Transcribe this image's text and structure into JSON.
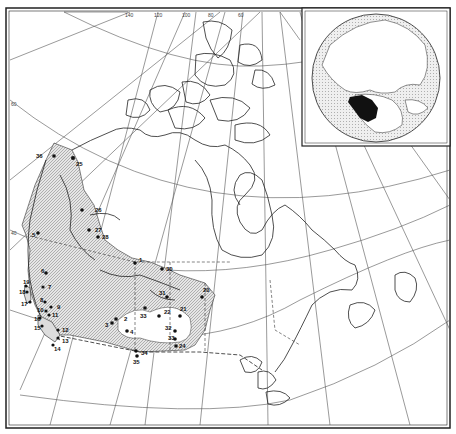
{
  "figure": {
    "type": "range map",
    "region": "Canada (western and central provinces and territories)",
    "inset": "Northern hemisphere globe with range highlighted in black"
  },
  "graticule": {
    "longitude_labels": [
      "140",
      "120",
      "100",
      "80",
      "60"
    ],
    "latitude_labels": [
      "60",
      "40"
    ]
  },
  "colors": {
    "ink": "#111111",
    "range_fill": "#cfcfcf",
    "ocean_inset": "#d8d8d8",
    "paper": "#ffffff"
  },
  "sites": [
    {
      "id": "1",
      "x": 135,
      "y": 263
    },
    {
      "id": "2",
      "x": 110,
      "y": 322
    },
    {
      "id": "3",
      "x": 118,
      "y": 327
    },
    {
      "id": "4",
      "x": 127,
      "y": 330
    },
    {
      "id": "5",
      "x": 38,
      "y": 233
    },
    {
      "id": "6",
      "x": 46,
      "y": 273
    },
    {
      "id": "7",
      "x": 43,
      "y": 287
    },
    {
      "id": "8",
      "x": 38,
      "y": 302
    },
    {
      "id": "9",
      "x": 51,
      "y": 307
    },
    {
      "id": "10",
      "x": 46,
      "y": 308
    },
    {
      "id": "11",
      "x": 49,
      "y": 315
    },
    {
      "id": "12",
      "x": 58,
      "y": 330
    },
    {
      "id": "13",
      "x": 58,
      "y": 338
    },
    {
      "id": "14",
      "x": 53,
      "y": 345
    },
    {
      "id": "15",
      "x": 40,
      "y": 326
    },
    {
      "id": "16",
      "x": 40,
      "y": 318
    },
    {
      "id": "17",
      "x": 30,
      "y": 302
    },
    {
      "id": "18",
      "x": 27,
      "y": 292
    },
    {
      "id": "19",
      "x": 26,
      "y": 286
    },
    {
      "id": "20",
      "x": 202,
      "y": 297
    },
    {
      "id": "22",
      "x": 159,
      "y": 316
    },
    {
      "id": "23",
      "x": 73,
      "y": 158
    },
    {
      "id": "24",
      "x": 175,
      "y": 345
    },
    {
      "id": "25",
      "x": 135,
      "y": 352
    },
    {
      "id": "26",
      "x": 82,
      "y": 210
    },
    {
      "id": "27",
      "x": 89,
      "y": 230
    },
    {
      "id": "28",
      "x": 98,
      "y": 237
    },
    {
      "id": "30",
      "x": 162,
      "y": 269
    },
    {
      "id": "31",
      "x": 167,
      "y": 300
    },
    {
      "id": "32",
      "x": 183,
      "y": 331
    },
    {
      "id": "33",
      "x": 145,
      "y": 308
    },
    {
      "id": "34",
      "x": 136,
      "y": 351
    },
    {
      "id": "36",
      "x": 54,
      "y": 156
    }
  ],
  "site_labels": [
    {
      "text": "36",
      "x": 36,
      "y": 156
    },
    {
      "text": "25",
      "x": 76,
      "y": 164
    },
    {
      "text": "26",
      "x": 96,
      "y": 211
    },
    {
      "text": "27",
      "x": 97,
      "y": 231
    },
    {
      "text": "28",
      "x": 103,
      "y": 238
    },
    {
      "text": "1",
      "x": 139,
      "y": 261
    },
    {
      "text": "5",
      "x": 34,
      "y": 238
    },
    {
      "text": "6",
      "x": 42,
      "y": 272
    },
    {
      "text": "19",
      "x": 23,
      "y": 282
    },
    {
      "text": "18",
      "x": 20,
      "y": 293
    },
    {
      "text": "17",
      "x": 23,
      "y": 305
    },
    {
      "text": "7",
      "x": 49,
      "y": 288
    },
    {
      "text": "8",
      "x": 38,
      "y": 302
    },
    {
      "text": "9",
      "x": 57,
      "y": 308
    },
    {
      "text": "10",
      "x": 36,
      "y": 311
    },
    {
      "text": "11",
      "x": 50,
      "y": 316
    },
    {
      "text": "16",
      "x": 34,
      "y": 321
    },
    {
      "text": "15",
      "x": 34,
      "y": 330
    },
    {
      "text": "12",
      "x": 63,
      "y": 333
    },
    {
      "text": "13",
      "x": 63,
      "y": 345
    },
    {
      "text": "14",
      "x": 55,
      "y": 352
    },
    {
      "text": "30",
      "x": 166,
      "y": 268
    },
    {
      "text": "20",
      "x": 203,
      "y": 291
    },
    {
      "text": "31",
      "x": 160,
      "y": 292
    },
    {
      "text": "21",
      "x": 181,
      "y": 312
    },
    {
      "text": "2",
      "x": 126,
      "y": 323
    },
    {
      "text": "3",
      "x": 107,
      "y": 327
    },
    {
      "text": "4",
      "x": 130,
      "y": 333
    },
    {
      "text": "33",
      "x": 141,
      "y": 320
    },
    {
      "text": "22",
      "x": 165,
      "y": 315
    },
    {
      "text": "32",
      "x": 168,
      "y": 329
    },
    {
      "text": "33",
      "x": 172,
      "y": 339
    },
    {
      "text": "24",
      "x": 179,
      "y": 346
    },
    {
      "text": "34",
      "x": 141,
      "y": 355
    },
    {
      "text": "35",
      "x": 133,
      "y": 364
    }
  ]
}
